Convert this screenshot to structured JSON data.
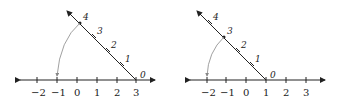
{
  "figures": [
    {
      "name": "left",
      "axis_ticks": [
        "−2",
        "−1",
        "0",
        "1",
        "2",
        "3"
      ],
      "diagonal_labels": [
        "0",
        "1",
        "2",
        "3",
        "4"
      ],
      "origin_at": "3",
      "arc_from": "4",
      "arc_to": "−1"
    },
    {
      "name": "right",
      "axis_ticks": [
        "−2",
        "−1",
        "0",
        "1",
        "2",
        "3"
      ],
      "diagonal_labels": [
        "0",
        "1",
        "2",
        "3",
        "4"
      ],
      "origin_at": "1",
      "arc_from": "3",
      "arc_to": "−2"
    }
  ],
  "colors": {
    "line": "#222222",
    "arc": "#888888"
  }
}
